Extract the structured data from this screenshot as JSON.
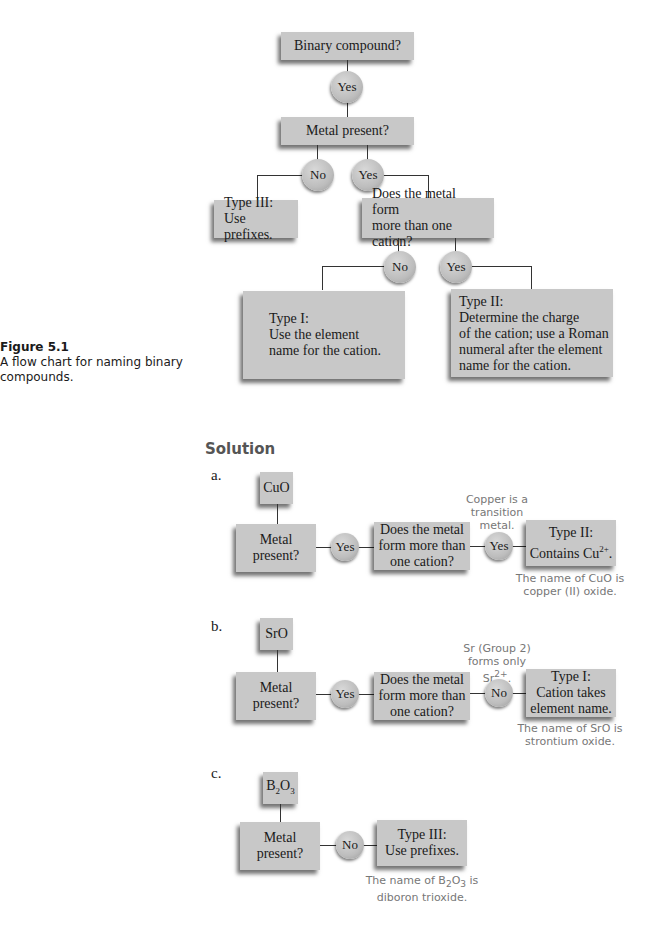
{
  "figure": {
    "title": "Figure 5.1",
    "caption": "A flow chart for naming binary compounds."
  },
  "flowchart": {
    "binary_compound": "Binary compound?",
    "yes1": "Yes",
    "metal_present": "Metal present?",
    "no1": "No",
    "yes2": "Yes",
    "type3": [
      "Type III:",
      "Use prefixes."
    ],
    "more_than_one": [
      "Does the metal form",
      "more than one cation?"
    ],
    "no2": "No",
    "yes3": "Yes",
    "type1": [
      "Type I:",
      "Use the element",
      "name for the cation."
    ],
    "type2": [
      "Type II:",
      "Determine the charge",
      "of the cation; use a Roman",
      "numeral  after the element",
      "name for the cation."
    ]
  },
  "solution": {
    "heading": "Solution",
    "a": {
      "label": "a.",
      "compound": "CuO",
      "metal_present": [
        "Metal",
        "present?"
      ],
      "answer1": "Yes",
      "question": [
        "Does the metal",
        "form more than",
        "one cation?"
      ],
      "note": [
        "Copper is a",
        "transition",
        "metal."
      ],
      "answer2": "Yes",
      "result": [
        "Type II:",
        "Contains Cu",
        "2+",
        "."
      ],
      "conclusion": [
        "The name of CuO is",
        "copper (II) oxide."
      ]
    },
    "b": {
      "label": "b.",
      "compound": "SrO",
      "metal_present": [
        "Metal",
        "present?"
      ],
      "answer1": "Yes",
      "question": [
        "Does the metal",
        "form more than",
        "one cation?"
      ],
      "note": [
        "Sr (Group 2)",
        "forms only",
        "Sr",
        "2+",
        "."
      ],
      "answer2": "No",
      "result": [
        "Type I:",
        "Cation takes",
        "element name."
      ],
      "conclusion": [
        "The name of SrO is",
        "strontium oxide."
      ]
    },
    "c": {
      "label": "c.",
      "compound": [
        "B",
        "2",
        "O",
        "3"
      ],
      "metal_present": [
        "Metal",
        "present?"
      ],
      "answer1": "No",
      "result": [
        "Type III:",
        "Use prefixes."
      ],
      "conclusion": [
        "The name of B",
        "2",
        "O",
        "3",
        " is",
        "diboron trioxide."
      ]
    }
  }
}
